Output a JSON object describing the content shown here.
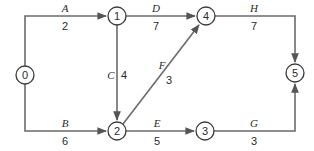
{
  "diagram": {
    "type": "activity-on-arrow network",
    "nodes": [
      {
        "id": "0",
        "label": "0",
        "x": 25,
        "y": 75
      },
      {
        "id": "1",
        "label": "1",
        "x": 117,
        "y": 16
      },
      {
        "id": "2",
        "label": "2",
        "x": 117,
        "y": 131
      },
      {
        "id": "3",
        "label": "3",
        "x": 205,
        "y": 131
      },
      {
        "id": "4",
        "label": "4",
        "x": 206,
        "y": 16
      },
      {
        "id": "5",
        "label": "5",
        "x": 295,
        "y": 73
      }
    ],
    "edges": [
      {
        "from": "0",
        "to": "1",
        "activity": "A",
        "duration": "2"
      },
      {
        "from": "0",
        "to": "2",
        "activity": "B",
        "duration": "6"
      },
      {
        "from": "1",
        "to": "2",
        "activity": "C",
        "duration": "4"
      },
      {
        "from": "1",
        "to": "4",
        "activity": "D",
        "duration": "7"
      },
      {
        "from": "2",
        "to": "3",
        "activity": "E",
        "duration": "5"
      },
      {
        "from": "2",
        "to": "4",
        "activity": "F",
        "duration": "3"
      },
      {
        "from": "3",
        "to": "5",
        "activity": "G",
        "duration": "3"
      },
      {
        "from": "4",
        "to": "5",
        "activity": "H",
        "duration": "7"
      }
    ]
  },
  "colors": {
    "edge": "#6b6b6b",
    "node_stroke": "#3a3a3a",
    "text": "#2a2a2a",
    "background": "#ffffff"
  }
}
